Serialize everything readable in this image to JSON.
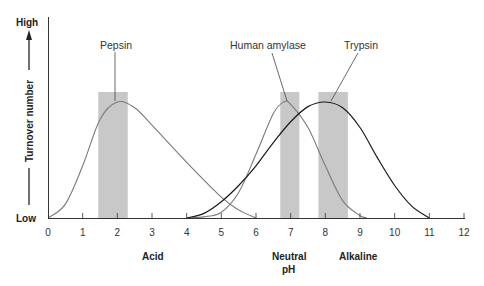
{
  "chart_data": {
    "type": "line",
    "title": "",
    "xlabel": "pH",
    "ylabel": "Turnover number",
    "xlim": [
      0,
      12
    ],
    "ylim": [
      "Low",
      "High"
    ],
    "x_ticks": [
      "0",
      "1",
      "2",
      "3",
      "4",
      "5",
      "6",
      "7",
      "8",
      "9",
      "10",
      "11",
      "12"
    ],
    "y_axis": {
      "low_label": "Low",
      "high_label": "High",
      "label": "Turnover number"
    },
    "x_region_labels": [
      {
        "text": "Acid",
        "x": 2.3
      },
      {
        "text": "Neutral",
        "text2": "pH",
        "x": 7.0
      },
      {
        "text": "Alkaline",
        "x": 9.0
      }
    ],
    "grid": false,
    "legend": "none (curves labeled directly)",
    "series": [
      {
        "name": "Pepsin",
        "optimum_pH": 2.0,
        "optimum_range": [
          1.5,
          2.3
        ],
        "range": [
          0,
          6
        ],
        "color": "#7a7a7a",
        "points": [
          [
            0,
            0
          ],
          [
            0.5,
            0.12
          ],
          [
            1,
            0.45
          ],
          [
            1.5,
            0.85
          ],
          [
            2,
            1.0
          ],
          [
            2.5,
            0.95
          ],
          [
            3,
            0.8
          ],
          [
            4,
            0.48
          ],
          [
            5,
            0.18
          ],
          [
            5.5,
            0.07
          ],
          [
            6,
            0
          ]
        ]
      },
      {
        "name": "Human amylase",
        "optimum_pH": 6.8,
        "optimum_range": [
          6.7,
          7.25
        ],
        "range": [
          4.0,
          9.2
        ],
        "color": "#7a7a7a",
        "points": [
          [
            4,
            0
          ],
          [
            4.5,
            0.01
          ],
          [
            5,
            0.05
          ],
          [
            5.5,
            0.22
          ],
          [
            6,
            0.55
          ],
          [
            6.5,
            0.9
          ],
          [
            6.8,
            1.0
          ],
          [
            7,
            0.98
          ],
          [
            7.5,
            0.78
          ],
          [
            8,
            0.45
          ],
          [
            8.5,
            0.15
          ],
          [
            9,
            0.02
          ],
          [
            9.2,
            0
          ]
        ]
      },
      {
        "name": "Trypsin",
        "optimum_pH": 8.0,
        "optimum_range": [
          7.8,
          8.65
        ],
        "range": [
          4.0,
          11.0
        ],
        "color": "#1a1a1a",
        "points": [
          [
            4,
            0
          ],
          [
            4.5,
            0.04
          ],
          [
            5,
            0.14
          ],
          [
            5.5,
            0.28
          ],
          [
            6,
            0.45
          ],
          [
            6.5,
            0.65
          ],
          [
            7,
            0.83
          ],
          [
            7.5,
            0.96
          ],
          [
            8,
            1.0
          ],
          [
            8.5,
            0.95
          ],
          [
            9,
            0.78
          ],
          [
            9.5,
            0.52
          ],
          [
            10,
            0.28
          ],
          [
            10.5,
            0.1
          ],
          [
            11,
            0
          ]
        ]
      }
    ],
    "shaded_bars": [
      {
        "series": "Pepsin",
        "x_from": 1.45,
        "x_to": 2.3
      },
      {
        "series": "Human amylase",
        "x_from": 6.7,
        "x_to": 7.25
      },
      {
        "series": "Trypsin",
        "x_from": 7.8,
        "x_to": 8.65
      }
    ],
    "colors": {
      "shade": "#c8c8c8",
      "axis": "#333333",
      "light_curve": "#7a7a7a",
      "dark_curve": "#1a1a1a"
    }
  },
  "labels": {
    "high": "High",
    "low": "Low",
    "y_axis_title": "Turnover number",
    "pepsin": "Pepsin",
    "amylase": "Human amylase",
    "trypsin": "Trypsin",
    "acid": "Acid",
    "neutral": "Neutral",
    "ph": "pH",
    "alkaline": "Alkaline"
  }
}
